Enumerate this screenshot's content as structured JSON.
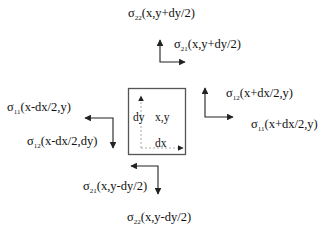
{
  "diagram": {
    "title": "",
    "element": {
      "center_label": "x,y",
      "dx_label": "dx",
      "dy_label": "dy"
    },
    "stresses": [
      {
        "id": "s22_top",
        "symbol": "σ",
        "sub": "22",
        "args": "(x,y+dy/2)"
      },
      {
        "id": "s21_top",
        "symbol": "σ",
        "sub": "21",
        "args": "(x,y+dy/2)"
      },
      {
        "id": "s12_right",
        "symbol": "σ",
        "sub": "12",
        "args": "(x+dx/2,y)"
      },
      {
        "id": "s11_right",
        "symbol": "σ",
        "sub": "11",
        "args": "(x+dx/2,y)"
      },
      {
        "id": "s11_left",
        "symbol": "σ",
        "sub": "11",
        "args": "(x-dx/2,y)"
      },
      {
        "id": "s12_left",
        "symbol": "σ",
        "sub": "12",
        "args": "(x-dx/2,dy)"
      },
      {
        "id": "s21_bottom",
        "symbol": "σ",
        "sub": "21",
        "args": "(x,y-dy/2)"
      },
      {
        "id": "s22_bottom",
        "symbol": "σ",
        "sub": "22",
        "args": "(x,y-dy/2)"
      }
    ],
    "colors": {
      "line": "#222222",
      "dashed": "#aaaaaa",
      "box": "#555555"
    }
  }
}
